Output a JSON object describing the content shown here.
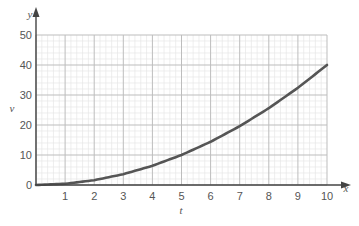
{
  "chart_data": {
    "type": "line",
    "title": "",
    "xlabel": "t",
    "ylabel": "v",
    "x_axis_end_label": "x",
    "y_axis_end_label": "y",
    "xlim": [
      0,
      10
    ],
    "ylim": [
      0,
      50
    ],
    "x_ticks": [
      1,
      2,
      3,
      4,
      5,
      6,
      7,
      8,
      9,
      10
    ],
    "y_ticks": [
      0,
      10,
      20,
      30,
      40,
      50
    ],
    "grid": true,
    "minor_grid_subdivisions": 5,
    "series": [
      {
        "name": "v = 0.4t^2",
        "x": [
          0,
          1,
          2,
          3,
          4,
          5,
          6,
          7,
          8,
          9,
          10
        ],
        "values": [
          0,
          0.4,
          1.6,
          3.6,
          6.4,
          10,
          14.4,
          19.6,
          25.6,
          32.4,
          40
        ],
        "color": "#555555"
      }
    ]
  },
  "colors": {
    "axis": "#444444",
    "major_grid": "#bdbdbd",
    "minor_grid": "#e6e6e6",
    "curve": "#555555"
  }
}
